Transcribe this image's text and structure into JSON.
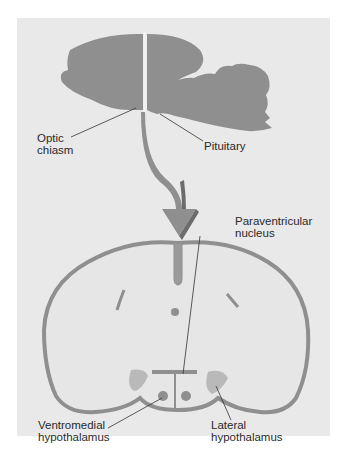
{
  "figure": {
    "labels": {
      "optic_chiasm": "Optic\nchiasm",
      "pituitary": "Pituitary",
      "paraventricular_nucleus": "Paraventricular\nnucleus",
      "ventromedial_hypothalamus": "Ventromedial\nhypothalamus",
      "lateral_hypothalamus": "Lateral\nhypothalamus"
    },
    "colors": {
      "background": "#e9e9e9",
      "brain_tissue": "#8f8f8f",
      "nucleus_light": "#b9b9b9",
      "outline": "#8a8a8a",
      "leader_line": "#333333"
    }
  }
}
